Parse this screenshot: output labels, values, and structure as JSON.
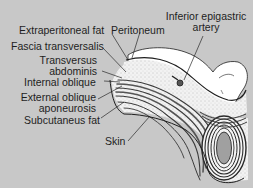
{
  "diagram": {
    "colors": {
      "background": "#c8c8c8",
      "tissue_fill": "#ffffff",
      "fat_fill": "#efefef",
      "muscle_stripe": "#555555",
      "outline": "#1e1e1e",
      "cord_fill": "#9a9a9a"
    },
    "labels": {
      "extraperitoneal_fat": "Extraperitoneal fat",
      "peritoneum": "Peritoneum",
      "inferior_epigastric_artery_line1": "Inferior epigastric",
      "inferior_epigastric_artery_line2": "artery",
      "fascia_transversalis": "Fascia transversalis",
      "transversus_abdominis_line1": "Transversus",
      "transversus_abdominis_line2": "abdominis",
      "internal_oblique": "Internal oblique",
      "external_oblique_aponeurosis_line1": "External oblique",
      "external_oblique_aponeurosis_line2": "aponeurosis",
      "subcutaneous_fat": "Subcutaneus fat",
      "skin": "Skin"
    }
  }
}
